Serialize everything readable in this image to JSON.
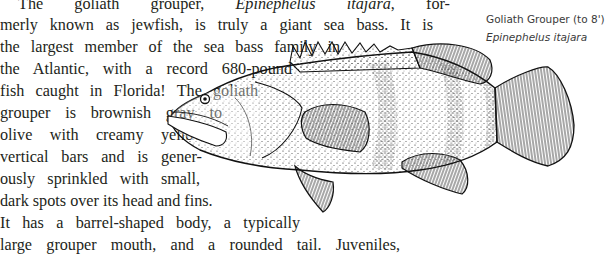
{
  "body_text": {
    "lines": [
      {
        "pre": "The goliath grouper, ",
        "italic": "Epinephelus itajara",
        "post": ", for-"
      },
      {
        "text": "merly known as jewfish, is truly a giant sea bass. It is"
      },
      {
        "text": "the largest member of the sea bass family in"
      },
      {
        "text": "the Atlantic, with a record 680-pound"
      },
      {
        "text": "fish caught in Florida! The goliath"
      },
      {
        "text": "grouper is brownish gray to"
      },
      {
        "text": "olive with creamy yellow"
      },
      {
        "text": "vertical bars and is gener-"
      },
      {
        "text": "ously sprinkled with small,"
      },
      {
        "text": "dark spots over its head and fins."
      },
      {
        "text": "It has a barrel-shaped body, a typically"
      },
      {
        "text": "large grouper mouth, and a rounded tail. Juveniles,"
      }
    ]
  },
  "figure": {
    "illustration": "goliath-grouper-illustration",
    "caption": {
      "common_name": "Goliath Grouper (to 8')",
      "scientific_name": "Epinephelus itajara"
    }
  }
}
